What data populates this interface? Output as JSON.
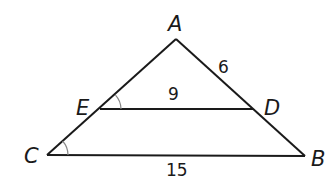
{
  "diagram": {
    "type": "geometry-triangle",
    "vertices": {
      "A": {
        "label": "A",
        "x": 176,
        "y": 39
      },
      "B": {
        "label": "B",
        "x": 305,
        "y": 156
      },
      "C": {
        "label": "C",
        "x": 47,
        "y": 155
      },
      "D": {
        "label": "D",
        "x": 253,
        "y": 109
      },
      "E": {
        "label": "E",
        "x": 100,
        "y": 109
      }
    },
    "segments": [
      {
        "from": "A",
        "to": "C"
      },
      {
        "from": "A",
        "to": "B"
      },
      {
        "from": "C",
        "to": "B"
      },
      {
        "from": "E",
        "to": "D"
      }
    ],
    "measurements": {
      "AD": "6",
      "ED": "9",
      "CB": "15"
    },
    "congruent_angles": [
      "AED",
      "ACB"
    ],
    "colors": {
      "stroke": "#1a1a1a",
      "angle_arc": "#888888",
      "background": "#ffffff"
    }
  }
}
